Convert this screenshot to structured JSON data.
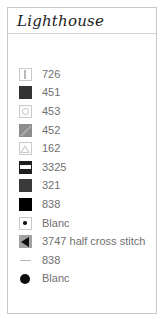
{
  "card": {
    "title": "Lighthouse",
    "border_color": "#c8c8c8",
    "divider_color": "#d2d2d2",
    "text_color": "#6f6f6f"
  },
  "legend": {
    "rows": [
      {
        "label": "726",
        "symbol_name": "square-vertical-bar-symbol",
        "swatch": "boxed",
        "fill": "#ffffff",
        "mark": "vbar"
      },
      {
        "label": "451",
        "symbol_name": "filled-dark-square-symbol",
        "swatch": "solid",
        "fill": "#333333",
        "mark": "none"
      },
      {
        "label": "453",
        "symbol_name": "square-circle-symbol",
        "swatch": "boxed",
        "fill": "#fbfbfb",
        "mark": "circle"
      },
      {
        "label": "452",
        "symbol_name": "gray-square-diagonal-symbol",
        "swatch": "solid",
        "fill": "#8c8c8c",
        "mark": "diag"
      },
      {
        "label": "162",
        "symbol_name": "square-triangle-outline-symbol",
        "swatch": "boxed",
        "fill": "#ffffff",
        "mark": "tri-outline"
      },
      {
        "label": "3325",
        "symbol_name": "dark-square-horizontal-band-symbol",
        "swatch": "solid",
        "fill": "#1e1e1e",
        "mark": "hband"
      },
      {
        "label": "321",
        "symbol_name": "filled-dark-gray-square-symbol",
        "swatch": "solid",
        "fill": "#3a3a3a",
        "mark": "none"
      },
      {
        "label": "838",
        "symbol_name": "filled-black-square-symbol",
        "swatch": "solid",
        "fill": "#000000",
        "mark": "none"
      },
      {
        "label": "Blanc",
        "symbol_name": "white-square-dot-symbol",
        "swatch": "boxed",
        "fill": "#ffffff",
        "mark": "dot"
      },
      {
        "label": "3747 half cross stitch",
        "symbol_name": "gray-square-left-triangle-symbol",
        "swatch": "solid",
        "fill": "#a2a2a2",
        "mark": "tri-left"
      },
      {
        "label": "838",
        "symbol_name": "backstitch-line-symbol",
        "swatch": "noborder",
        "fill": "transparent",
        "mark": "line"
      },
      {
        "label": "Blanc",
        "symbol_name": "french-knot-dot-symbol",
        "swatch": "noborder",
        "fill": "transparent",
        "mark": "knot"
      }
    ]
  }
}
